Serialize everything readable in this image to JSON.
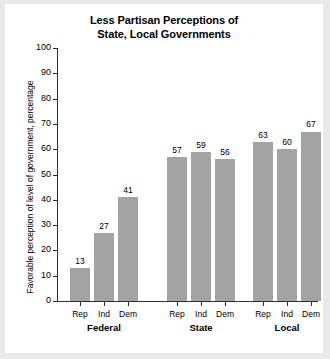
{
  "chart_data": {
    "type": "bar",
    "title": "Less Partisan Perceptions of State, Local Governments",
    "title_lines": [
      "Less Partisan Perceptions of",
      "State, Local Governments"
    ],
    "xlabel": "",
    "ylabel": "Favorable perception of level of government, percentage",
    "ylim": [
      0,
      100
    ],
    "yticks": [
      0,
      10,
      20,
      30,
      40,
      50,
      60,
      70,
      80,
      90,
      100
    ],
    "ytick_labels": [
      "0",
      "10",
      "20",
      "30",
      "40",
      "50",
      "60",
      "70",
      "80",
      "90",
      "100"
    ],
    "grid": false,
    "legend": false,
    "bar_color": "#a3a3a3",
    "axis_color": "#2e2e2e",
    "groups": [
      "Federal",
      "State",
      "Local"
    ],
    "categories": [
      "Rep",
      "Ind",
      "Dem"
    ],
    "series": [
      {
        "name": "Federal",
        "values": [
          13,
          27,
          41
        ]
      },
      {
        "name": "State",
        "values": [
          57,
          59,
          56
        ]
      },
      {
        "name": "Local",
        "values": [
          63,
          60,
          67
        ]
      }
    ],
    "bars": [
      {
        "group": "Federal",
        "category": "Rep",
        "value": 13,
        "label": "13"
      },
      {
        "group": "Federal",
        "category": "Ind",
        "value": 27,
        "label": "27"
      },
      {
        "group": "Federal",
        "category": "Dem",
        "value": 41,
        "label": "41"
      },
      {
        "group": "State",
        "category": "Rep",
        "value": 57,
        "label": "57"
      },
      {
        "group": "State",
        "category": "Ind",
        "value": 59,
        "label": "59"
      },
      {
        "group": "State",
        "category": "Dem",
        "value": 56,
        "label": "56"
      },
      {
        "group": "Local",
        "category": "Rep",
        "value": 63,
        "label": "63"
      },
      {
        "group": "Local",
        "category": "Ind",
        "value": 60,
        "label": "60"
      },
      {
        "group": "Local",
        "category": "Dem",
        "value": 67,
        "label": "67"
      }
    ]
  }
}
